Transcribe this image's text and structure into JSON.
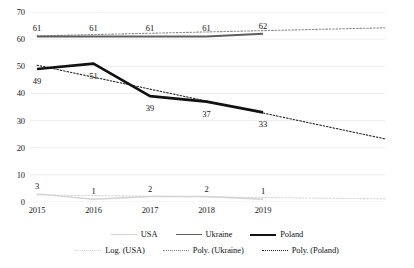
{
  "chart_data": {
    "type": "line",
    "title": "",
    "xlabel": "",
    "ylabel": "",
    "categories": [
      "2015",
      "2016",
      "2017",
      "2018",
      "2019"
    ],
    "ylim": [
      0,
      70
    ],
    "ytick_values": [
      0,
      10,
      20,
      30,
      40,
      50,
      60,
      70
    ],
    "ytick_labels": [
      "0",
      "10",
      "20",
      "30",
      "40",
      "50",
      "60",
      "70"
    ],
    "grid": true,
    "grid_axis": "y",
    "legend_position": "bottom",
    "series": [
      {
        "name": "USA",
        "values": [
          3,
          1,
          2,
          2,
          1
        ],
        "labels": [
          "3",
          "1",
          "2",
          "2",
          "1"
        ],
        "color": "#d3d3d3",
        "style": "solid"
      },
      {
        "name": "Ukraine",
        "values": [
          61,
          61,
          61,
          61,
          62
        ],
        "labels": [
          "61",
          "61",
          "61",
          "61",
          "62"
        ],
        "color": "#5f5f5f",
        "style": "solid"
      },
      {
        "name": "Poland",
        "values": [
          49,
          51,
          39,
          37,
          33
        ],
        "labels": [
          "49",
          "51",
          "39",
          "37",
          "33"
        ],
        "color": "#111111",
        "style": "solid"
      }
    ],
    "trendlines": [
      {
        "name": "Log. (USA)",
        "color": "#d6d6d6",
        "style": "dotted",
        "from": [
          0,
          2.6
        ],
        "to": [
          6.4,
          1.1
        ]
      },
      {
        "name": "Poly. (Ukraine)",
        "color": "#8d8d8d",
        "style": "dotted",
        "from": [
          0,
          61.2
        ],
        "to": [
          6.4,
          64.3
        ]
      },
      {
        "name": "Poly. (Poland)",
        "color": "#2a2a2a",
        "style": "dotted",
        "from": [
          0,
          50.4
        ],
        "to": [
          6.4,
          22.2
        ]
      }
    ],
    "legend": [
      {
        "label": "USA",
        "swatch": "sw-usa"
      },
      {
        "label": "Ukraine",
        "swatch": "sw-ukraine"
      },
      {
        "label": "Poland",
        "swatch": "sw-poland"
      },
      {
        "label": "Log. (USA)",
        "swatch": "sw-log-usa"
      },
      {
        "label": "Poly. (Ukraine)",
        "swatch": "sw-poly-ukr"
      },
      {
        "label": "Poly. (Poland)",
        "swatch": "sw-poly-pol"
      }
    ]
  }
}
